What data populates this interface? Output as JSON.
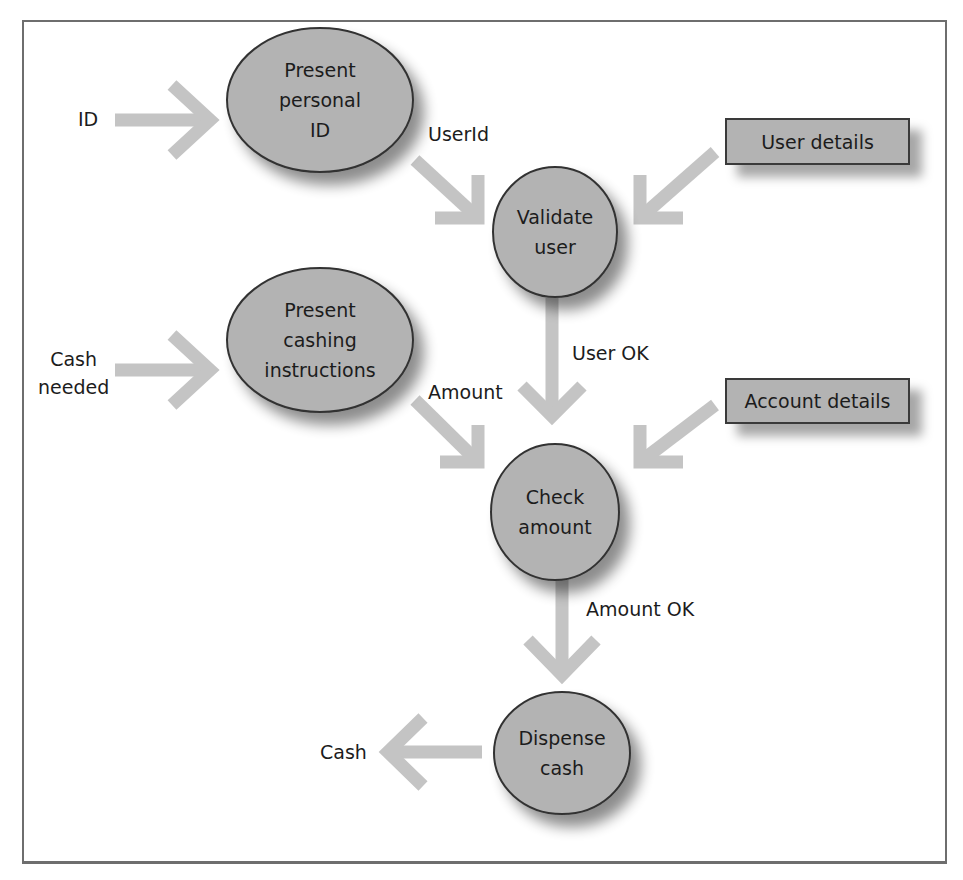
{
  "diagram": {
    "type": "data-flow-diagram",
    "colors": {
      "process_fill": "#b3b3b3",
      "process_stroke": "#333333",
      "arrow": "#c4c4c4",
      "store_fill": "#b3b3b3",
      "frame_border": "#6e6e6e"
    },
    "processes": [
      {
        "id": "p1",
        "label": "Present personal ID",
        "lines": [
          "Present",
          "personal",
          "ID"
        ]
      },
      {
        "id": "p2",
        "label": "Validate user",
        "lines": [
          "Validate",
          "user"
        ]
      },
      {
        "id": "p3",
        "label": "Present cashing instructions",
        "lines": [
          "Present",
          "cashing",
          "instructions"
        ]
      },
      {
        "id": "p4",
        "label": "Check amount",
        "lines": [
          "Check",
          "amount"
        ]
      },
      {
        "id": "p5",
        "label": "Dispense cash",
        "lines": [
          "Dispense",
          "cash"
        ]
      }
    ],
    "data_stores": [
      {
        "id": "s1",
        "label": "User details"
      },
      {
        "id": "s2",
        "label": "Account details"
      }
    ],
    "external_inputs": [
      {
        "id": "e1",
        "label": "ID"
      },
      {
        "id": "e2",
        "label": "Cash needed",
        "lines": [
          "Cash",
          "needed"
        ]
      }
    ],
    "external_outputs": [
      {
        "id": "o1",
        "label": "Cash"
      }
    ],
    "flows": [
      {
        "from": "ID",
        "to": "Present personal ID",
        "label": ""
      },
      {
        "from": "Present personal ID",
        "to": "Validate user",
        "label": "UserId"
      },
      {
        "from": "User details",
        "to": "Validate user",
        "label": ""
      },
      {
        "from": "Cash needed",
        "to": "Present cashing instructions",
        "label": ""
      },
      {
        "from": "Validate user",
        "to": "Check amount",
        "label": "User OK"
      },
      {
        "from": "Present cashing instructions",
        "to": "Check amount",
        "label": "Amount"
      },
      {
        "from": "Account details",
        "to": "Check amount",
        "label": ""
      },
      {
        "from": "Check amount",
        "to": "Dispense cash",
        "label": "Amount OK"
      },
      {
        "from": "Dispense cash",
        "to": "Cash",
        "label": ""
      }
    ],
    "flow_labels": {
      "userid": "UserId",
      "user_ok": "User OK",
      "amount": "Amount",
      "amount_ok": "Amount OK"
    }
  }
}
